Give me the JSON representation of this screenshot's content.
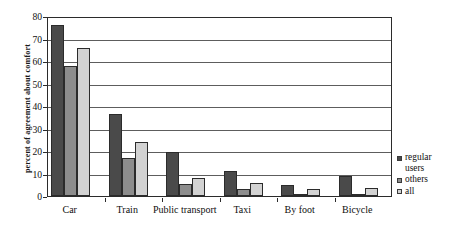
{
  "chart_data": {
    "type": "bar",
    "title": "",
    "xlabel": "",
    "ylabel": "percent of agreement about comfort",
    "ylim": [
      0,
      80
    ],
    "yticks": [
      0,
      10,
      20,
      30,
      40,
      50,
      60,
      70,
      80
    ],
    "grid": true,
    "legend_position": "right",
    "categories": [
      "Car",
      "Train",
      "Public transport",
      "Taxi",
      "By foot",
      "Bicycle"
    ],
    "series": [
      {
        "name": "regular users",
        "legend_label": "regular\nusers",
        "color": "#4a4a4a",
        "values": [
          76,
          36.5,
          19.5,
          11,
          5,
          9
        ]
      },
      {
        "name": "others",
        "legend_label": "others",
        "color": "#8d8d8d",
        "values": [
          58,
          17,
          5.5,
          3,
          0.5,
          0.5
        ]
      },
      {
        "name": "all",
        "legend_label": "all",
        "color": "#d2d2d2",
        "values": [
          66,
          24,
          8,
          6,
          3,
          3.5
        ]
      }
    ]
  },
  "axes": {
    "y_title": "percent of agreement about comfort",
    "y_tick_labels": [
      "80",
      "70",
      "60",
      "50",
      "40",
      "30",
      "20",
      "10",
      "0"
    ],
    "x_tick_labels": [
      "Car",
      "Train",
      "Public transport",
      "Taxi",
      "By foot",
      "Bicycle"
    ]
  },
  "legend": {
    "entries": [
      {
        "label": "regular\nusers",
        "swatch": "#4a4a4a"
      },
      {
        "label": "others",
        "swatch": "#8d8d8d"
      },
      {
        "label": "all",
        "swatch": "#d2d2d2"
      }
    ]
  },
  "colors": {
    "series_regular_users": "#4a4a4a",
    "series_others": "#8d8d8d",
    "series_all": "#d2d2d2",
    "axis": "#2b2b2b",
    "gridline": "#5d5d5d",
    "background": "#ffffff"
  }
}
